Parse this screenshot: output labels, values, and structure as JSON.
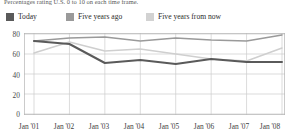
{
  "subtitle": "Percentages rating U.S. 0 to 10 on each time frame.",
  "legend": {
    "position": "top-left",
    "items": [
      {
        "label": "Today",
        "color": "#5a5a5a"
      },
      {
        "label": "Five years ago",
        "color": "#9a9a9a"
      },
      {
        "label": "Five years from now",
        "color": "#cfcfcf"
      }
    ]
  },
  "chart_data": {
    "type": "line",
    "title": "",
    "subtitle": "Percentages rating U.S. 0 to 10 on each time frame.",
    "xlabel": "",
    "ylabel": "",
    "categories": [
      "Jan '01",
      "Jan '02",
      "Jan '03",
      "Jan '04",
      "Jan '05",
      "Jan '06",
      "Jan '07",
      "Jan '08"
    ],
    "series": [
      {
        "name": "Today",
        "color": "#5a5a5a",
        "values": [
          73,
          70,
          51,
          54,
          50,
          55,
          52,
          52
        ]
      },
      {
        "name": "Five years ago",
        "color": "#9a9a9a",
        "values": [
          73,
          76,
          77,
          73,
          76,
          74,
          73,
          79
        ]
      },
      {
        "name": "Five years from now",
        "color": "#cfcfcf",
        "values": [
          61,
          72,
          63,
          65,
          60,
          55,
          53,
          66
        ]
      }
    ],
    "ylim": [
      0,
      80
    ],
    "yticks": [
      0,
      20,
      40,
      60,
      80
    ],
    "ytick_labels": [
      "0",
      "20",
      "40",
      "60",
      "80"
    ],
    "grid": true,
    "legend_position": "top-left"
  }
}
